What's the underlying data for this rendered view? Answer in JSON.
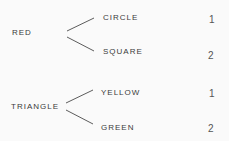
{
  "diagram": {
    "type": "tree",
    "groups": [
      {
        "root": "RED",
        "branches": [
          {
            "label": "CIRCLE",
            "value": "1"
          },
          {
            "label": "SQUARE",
            "value": "2"
          }
        ]
      },
      {
        "root": "TRIANGLE",
        "branches": [
          {
            "label": "YELLOW",
            "value": "1"
          },
          {
            "label": "GREEN",
            "value": "2"
          }
        ]
      }
    ],
    "colors": {
      "background": "#fafafa",
      "text": "#3a3a3a",
      "line": "#4a4a4a"
    }
  }
}
